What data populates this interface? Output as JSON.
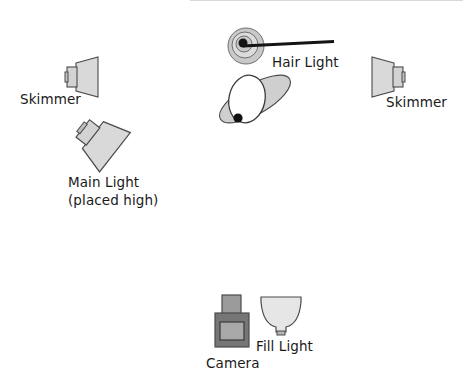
{
  "diagram": {
    "background_color": "#ffffff",
    "fill_color": "#d9d9d9",
    "fill_color_light": "#e2e2e2",
    "stroke_color": "#3a3a3a",
    "dark_gray": "#808080",
    "camera_body_color": "#787878",
    "camera_lens_color": "#a8a8a8",
    "text_color": "#1a1a1a",
    "accent_black": "#111111"
  },
  "labels": {
    "skimmer_left": "Skimmer",
    "skimmer_right": "Skimmer",
    "hair_light": "Hair Light",
    "main_light_line1": "Main Light",
    "main_light_line2": "(placed high)",
    "camera": "Camera",
    "fill_light": "Fill Light"
  },
  "elements": [
    {
      "name": "skimmer-left",
      "label": "Skimmer",
      "x": 64,
      "y": 57
    },
    {
      "name": "skimmer-right",
      "label": "Skimmer",
      "x": 364,
      "y": 57
    },
    {
      "name": "hair-light",
      "label": "Hair Light",
      "x": 231,
      "y": 31
    },
    {
      "name": "main-light",
      "label": "Main Light (placed high)",
      "x": 74,
      "y": 124
    },
    {
      "name": "subject",
      "label": "Subject",
      "x": 213,
      "y": 67
    },
    {
      "name": "camera",
      "label": "Camera",
      "x": 212,
      "y": 296
    },
    {
      "name": "fill-light",
      "label": "Fill Light",
      "x": 259,
      "y": 296
    }
  ]
}
